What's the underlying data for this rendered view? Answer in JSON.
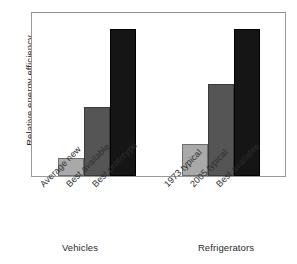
{
  "chart_data": {
    "type": "bar",
    "title": "",
    "subtitle": "",
    "xlabel": "",
    "ylabel": "Relative energy efficiency",
    "ylim": [
      0,
      1.05
    ],
    "grid": false,
    "legend": null,
    "axis_ticks_visible": false,
    "categories": [
      "Average new",
      "Best available",
      "Best prototype",
      "1973 typical",
      "2005 typical",
      "Best available"
    ],
    "values": [
      0.115,
      0.44,
      0.94,
      0.205,
      0.59,
      0.94
    ],
    "bar_shades": [
      "light",
      "medium",
      "dark",
      "light",
      "medium",
      "dark"
    ],
    "groups": [
      {
        "name": "Vehicles",
        "categories": [
          "Average new",
          "Best available",
          "Best prototype"
        ],
        "values": [
          0.115,
          0.44,
          0.94
        ],
        "shades": [
          "light",
          "medium",
          "dark"
        ]
      },
      {
        "name": "Refrigerators",
        "categories": [
          "1973 typical",
          "2005 typical",
          "Best available"
        ],
        "values": [
          0.205,
          0.59,
          0.94
        ],
        "shades": [
          "light",
          "medium",
          "dark"
        ]
      }
    ],
    "colors": {
      "light": "#a9a9a9",
      "medium": "#555555",
      "dark": "#151515",
      "frame": "#9a9a9a",
      "text": "#2b2b2b",
      "background": "#ffffff"
    }
  },
  "axes": {
    "y_title": "Relative energy efficiency"
  },
  "tick_labels": [
    "Average new",
    "Best available",
    "Best prototype",
    "1973 typical",
    "2005 typical",
    "Best available"
  ],
  "group_labels": [
    "Vehicles",
    "Refrigerators"
  ]
}
